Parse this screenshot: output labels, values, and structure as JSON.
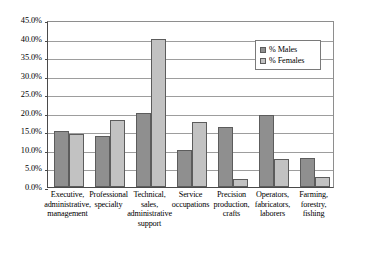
{
  "chart_data": {
    "type": "bar",
    "title": "",
    "subtitle": "",
    "xlabel": "",
    "ylabel": "",
    "ylim": [
      0,
      45
    ],
    "ytick_labels": [
      "45.0%",
      "40.0%",
      "35.0%",
      "30.0%",
      "25.0%",
      "20.0%",
      "15.0%",
      "10.0%",
      "5.0%",
      "0.0%"
    ],
    "ytick_values": [
      45,
      40,
      35,
      30,
      25,
      20,
      15,
      10,
      5,
      0
    ],
    "grid": true,
    "legend_position": "upper-right",
    "categories": [
      "Executive, administrative, management",
      "Professional specialty",
      "Technical, sales, administrative support",
      "Service occupations",
      "Precision production, crafts",
      "Operators, fabricators, laborers",
      "Farming, forestry, fishing"
    ],
    "category_lines": [
      [
        "Executive,",
        "administrative,",
        "management"
      ],
      [
        "Professional",
        "specialty"
      ],
      [
        "Technical,",
        "sales,",
        "administrative",
        "support"
      ],
      [
        "Service",
        "occupations"
      ],
      [
        "Precision",
        "production,",
        "crafts"
      ],
      [
        "Operators,",
        "fabricators,",
        "laborers"
      ],
      [
        "Farming,",
        "forestry,",
        "fishing"
      ]
    ],
    "series": [
      {
        "name": "% Males",
        "color": "#8f8f8f",
        "values": [
          15.2,
          13.7,
          19.9,
          10.0,
          16.2,
          19.3,
          7.9
        ]
      },
      {
        "name": "% Females",
        "color": "#c2c2c2",
        "values": [
          14.3,
          18.0,
          40.0,
          17.5,
          2.2,
          7.5,
          2.8
        ]
      }
    ]
  },
  "legend": {
    "entries": [
      {
        "label": "% Males"
      },
      {
        "label": "% Females"
      }
    ]
  }
}
